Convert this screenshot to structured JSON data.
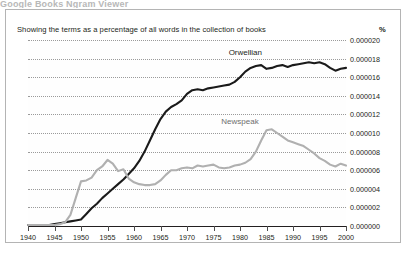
{
  "title_sliver": "Google Books Ngram Viewer",
  "panel": {
    "subtitle": "Showing the terms as a percentage of all words in the collection of books",
    "unit_label": "%"
  },
  "chart_data": {
    "type": "line",
    "title": "",
    "subtitle": "Showing the terms as a percentage of all words in the collection of books",
    "xlabel": "",
    "ylabel": "%",
    "xlim": [
      1940,
      2000
    ],
    "ylim": [
      0.0,
      2e-05
    ],
    "grid": true,
    "legend": "inline-annotations",
    "xticks": [
      1940,
      1945,
      1950,
      1955,
      1960,
      1965,
      1970,
      1975,
      1980,
      1985,
      1990,
      1995,
      2000
    ],
    "yticks": [
      "0.000000",
      "0.000002",
      "0.000004",
      "0.000006",
      "0.000008",
      "0.000010",
      "0.000012",
      "0.000014",
      "0.000016",
      "0.000018",
      "0.000020"
    ],
    "ytick_values": [
      0.0,
      2e-06,
      4e-06,
      6e-06,
      8e-06,
      1e-05,
      1.2e-05,
      1.4e-05,
      1.6e-05,
      1.8e-05,
      2e-05
    ],
    "x": [
      1940,
      1941,
      1942,
      1943,
      1944,
      1945,
      1946,
      1947,
      1948,
      1949,
      1950,
      1951,
      1952,
      1953,
      1954,
      1955,
      1956,
      1957,
      1958,
      1959,
      1960,
      1961,
      1962,
      1963,
      1964,
      1965,
      1966,
      1967,
      1968,
      1969,
      1970,
      1971,
      1972,
      1973,
      1974,
      1975,
      1976,
      1977,
      1978,
      1979,
      1980,
      1981,
      1982,
      1983,
      1984,
      1985,
      1986,
      1987,
      1988,
      1989,
      1990,
      1991,
      1992,
      1993,
      1994,
      1995,
      1996,
      1997,
      1998,
      1999,
      2000
    ],
    "series": [
      {
        "name": "Orwellian",
        "color": "#1a1a1a",
        "label_position": {
          "x": 1981,
          "y": 1.87e-05
        },
        "values": [
          1e-07,
          1e-07,
          1e-07,
          1e-07,
          1e-07,
          2e-07,
          3e-07,
          4e-07,
          5e-07,
          6e-07,
          7e-07,
          1.3e-06,
          1.9e-06,
          2.4e-06,
          3e-06,
          3.5e-06,
          4e-06,
          4.5e-06,
          5e-06,
          5.6e-06,
          6.2e-06,
          7e-06,
          8e-06,
          9.2e-06,
          1.04e-05,
          1.15e-05,
          1.23e-05,
          1.28e-05,
          1.31e-05,
          1.35e-05,
          1.42e-05,
          1.46e-05,
          1.47e-05,
          1.46e-05,
          1.48e-05,
          1.49e-05,
          1.5e-05,
          1.51e-05,
          1.52e-05,
          1.55e-05,
          1.6e-05,
          1.66e-05,
          1.7e-05,
          1.72e-05,
          1.73e-05,
          1.69e-05,
          1.7e-05,
          1.72e-05,
          1.73e-05,
          1.71e-05,
          1.73e-05,
          1.74e-05,
          1.75e-05,
          1.76e-05,
          1.75e-05,
          1.76e-05,
          1.74e-05,
          1.7e-05,
          1.67e-05,
          1.69e-05,
          1.7e-05
        ]
      },
      {
        "name": "Newspeak",
        "color": "#b0b0b0",
        "label_position": {
          "x": 1980,
          "y": 1.13e-05
        },
        "values": [
          1e-07,
          1e-07,
          1e-07,
          1e-07,
          1e-07,
          1e-07,
          2e-07,
          4e-07,
          1.2e-06,
          3e-06,
          4.8e-06,
          4.9e-06,
          5.2e-06,
          6e-06,
          6.4e-06,
          7.1e-06,
          6.7e-06,
          5.9e-06,
          6.1e-06,
          5.1e-06,
          4.7e-06,
          4.5e-06,
          4.4e-06,
          4.4e-06,
          4.5e-06,
          4.9e-06,
          5.5e-06,
          6e-06,
          6e-06,
          6.2e-06,
          6.3e-06,
          6.2e-06,
          6.5e-06,
          6.4e-06,
          6.5e-06,
          6.6e-06,
          6.3e-06,
          6.2e-06,
          6.3e-06,
          6.5e-06,
          6.6e-06,
          6.8e-06,
          7.2e-06,
          8e-06,
          9.2e-06,
          1.03e-05,
          1.04e-05,
          1e-05,
          9.6e-06,
          9.2e-06,
          9e-06,
          8.8e-06,
          8.6e-06,
          8.2e-06,
          7.8e-06,
          7.3e-06,
          7e-06,
          6.6e-06,
          6.4e-06,
          6.7e-06,
          6.5e-06
        ]
      }
    ],
    "annotations": [
      {
        "text": "Orwellian",
        "series": "Orwellian"
      },
      {
        "text": "Newspeak",
        "series": "Newspeak"
      }
    ]
  }
}
